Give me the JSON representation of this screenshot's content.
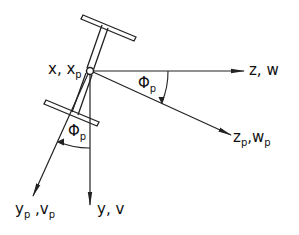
{
  "diagram": {
    "type": "coordinate-axes",
    "origin_label": {
      "main": "x, x",
      "sub": "p"
    },
    "axes": [
      {
        "id": "z",
        "label": "z, w"
      },
      {
        "id": "zp",
        "label_parts": [
          "z",
          "p",
          ",w",
          "p"
        ]
      },
      {
        "id": "y",
        "label": "y, v"
      },
      {
        "id": "yp",
        "label_parts": [
          "y",
          "p",
          " ,v",
          "p"
        ]
      }
    ],
    "angles": [
      {
        "id": "phi_p_upper",
        "symbol": "Φ",
        "sub": "p",
        "between": [
          "z",
          "zp"
        ]
      },
      {
        "id": "phi_p_lower",
        "symbol": "Φ",
        "sub": "p",
        "between": [
          "y",
          "yp"
        ]
      }
    ],
    "colors": {
      "stroke": "#222222",
      "background": "#ffffff"
    }
  }
}
